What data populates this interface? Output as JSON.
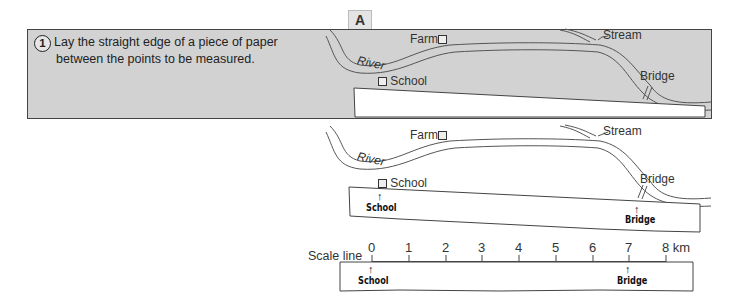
{
  "figure_label": "A",
  "panels": [
    {
      "number": "1",
      "text_lines": [
        "Lay the straight edge of a piece of paper",
        "between the points to be measured."
      ],
      "map_labels": {
        "farm": "Farm",
        "stream": "Stream",
        "river": "River",
        "school": "School",
        "bridge": "Bridge"
      }
    },
    {
      "number": "2",
      "text_lines": [
        "Mark the position of the school and bridge",
        "on the piece of paper."
      ],
      "map_labels": {
        "farm": "Farm",
        "stream": "Stream",
        "river": "River",
        "school": "School",
        "bridge": "Bridge"
      },
      "paper_marks": {
        "school": "School",
        "bridge": "Bridge"
      }
    },
    {
      "number": "3",
      "text_lines": [
        "Place the piece of paper on the scale line",
        "of the map. Read off the distance.",
        "It is 7 km."
      ],
      "scale_label": "Scale line",
      "scale_ticks": [
        "0",
        "1",
        "2",
        "3",
        "4",
        "5",
        "6",
        "7",
        "8 km"
      ],
      "paper_marks": {
        "school": "School",
        "bridge": "Bridge"
      }
    }
  ],
  "colors": {
    "panel_bg": "#d2d2d2",
    "paper": "#ffffff",
    "border": "#444444"
  }
}
